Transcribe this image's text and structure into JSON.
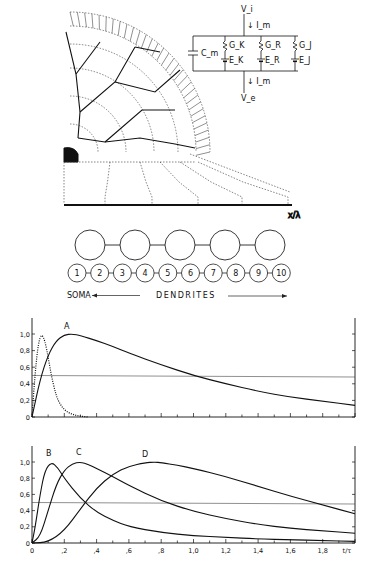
{
  "figure": {
    "neuron_diagram": {
      "axis_label": "x/λ",
      "circuit": {
        "top_node": "V_i",
        "bottom_node": "V_e",
        "current_top": "I_m",
        "current_bottom": "I_m",
        "capacitor": "C_m",
        "branches": [
          {
            "conductance": "G_K",
            "emf": "E_K"
          },
          {
            "conductance": "G_R",
            "emf": "E_R"
          },
          {
            "conductance": "G_J",
            "emf": "E_J"
          }
        ]
      }
    },
    "compartment_chain_5": {
      "count": 5
    },
    "compartment_chain_10": {
      "labels": [
        "1",
        "2",
        "3",
        "4",
        "5",
        "6",
        "7",
        "8",
        "9",
        "10"
      ],
      "soma_label": "SOMA",
      "dendrites_label": "DENDRITES"
    }
  },
  "chart_data": [
    {
      "type": "line",
      "title": "",
      "annotation": "A",
      "xlabel": "",
      "ylabel": "",
      "yticks": [
        "0",
        "0,2",
        "0,4",
        "0,6",
        "0,8",
        "1,0"
      ],
      "ylim": [
        0,
        1.1
      ],
      "xlim": [
        0,
        2.0
      ],
      "grid": false,
      "reference_line": 0.5,
      "series": [
        {
          "name": "A",
          "style": "solid",
          "x": [
            0,
            0.05,
            0.1,
            0.15,
            0.2,
            0.25,
            0.3,
            0.4,
            0.5,
            0.6,
            0.8,
            1.0,
            1.2,
            1.4,
            1.6,
            1.8,
            2.0
          ],
          "y": [
            0,
            0.45,
            0.75,
            0.92,
            0.99,
            1.0,
            0.98,
            0.92,
            0.85,
            0.77,
            0.63,
            0.5,
            0.4,
            0.31,
            0.24,
            0.19,
            0.14
          ]
        },
        {
          "name": "input pulse",
          "style": "dotted",
          "x": [
            0,
            0.02,
            0.04,
            0.06,
            0.08,
            0.1,
            0.12,
            0.14,
            0.16,
            0.2,
            0.25,
            0.3,
            0.35
          ],
          "y": [
            0,
            0.55,
            0.9,
            1.0,
            0.92,
            0.72,
            0.5,
            0.33,
            0.2,
            0.08,
            0.03,
            0.01,
            0
          ]
        }
      ]
    },
    {
      "type": "line",
      "title": "",
      "xlabel": "t/τ",
      "ylabel": "",
      "xticks": [
        "0",
        ",2",
        ",4",
        ",6",
        ",8",
        "1,0",
        "1,2",
        "1,4",
        "1,6",
        "1,8"
      ],
      "yticks": [
        "0",
        "0,2",
        "0,4",
        "0,6",
        "0,8",
        "1,0"
      ],
      "ylim": [
        0,
        1.1
      ],
      "xlim": [
        0,
        2.0
      ],
      "grid": false,
      "reference_line": 0.5,
      "series": [
        {
          "name": "B",
          "style": "solid",
          "x": [
            0,
            0.02,
            0.05,
            0.08,
            0.12,
            0.16,
            0.2,
            0.3,
            0.4,
            0.5,
            0.6,
            0.8,
            1.0,
            1.2,
            1.4,
            1.6,
            1.8,
            2.0
          ],
          "y": [
            0,
            0.2,
            0.6,
            0.9,
            1.0,
            0.93,
            0.8,
            0.55,
            0.38,
            0.28,
            0.2,
            0.13,
            0.09,
            0.07,
            0.05,
            0.04,
            0.03,
            0.02
          ]
        },
        {
          "name": "C",
          "style": "solid",
          "x": [
            0,
            0.05,
            0.1,
            0.15,
            0.2,
            0.25,
            0.3,
            0.35,
            0.4,
            0.5,
            0.6,
            0.8,
            1.0,
            1.2,
            1.4,
            1.6,
            1.8,
            2.0
          ],
          "y": [
            0,
            0.08,
            0.4,
            0.72,
            0.9,
            0.98,
            1.0,
            0.97,
            0.92,
            0.82,
            0.71,
            0.52,
            0.39,
            0.3,
            0.23,
            0.18,
            0.15,
            0.12
          ]
        },
        {
          "name": "D",
          "style": "solid",
          "x": [
            0,
            0.1,
            0.2,
            0.3,
            0.4,
            0.5,
            0.6,
            0.7,
            0.76,
            0.8,
            0.9,
            1.0,
            1.2,
            1.4,
            1.6,
            1.8,
            2.0
          ],
          "y": [
            0,
            0.01,
            0.15,
            0.42,
            0.68,
            0.85,
            0.95,
            0.99,
            1.0,
            0.99,
            0.96,
            0.92,
            0.82,
            0.7,
            0.58,
            0.47,
            0.36
          ]
        }
      ]
    }
  ]
}
